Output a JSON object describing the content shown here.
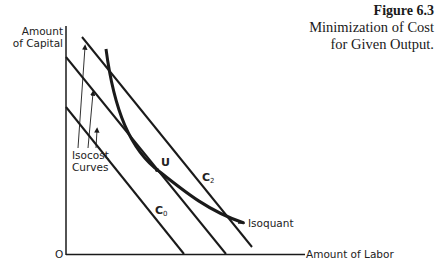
{
  "figure": {
    "number": "Figure 6.3",
    "title_line1": "Minimization of Cost",
    "title_line2": "for Given Output."
  },
  "axes": {
    "y_label_line1": "Amount",
    "y_label_line2": "of Capital",
    "x_label": "Amount of Labor",
    "origin_label": "O"
  },
  "labels": {
    "isocost_line1": "Isocost",
    "isocost_line2": "Curves",
    "tangency_point": "U",
    "c2_letter": "C",
    "c2_sub": "2",
    "c0_letter": "C",
    "c0_sub": "0",
    "isoquant": "Isoquant"
  },
  "colors": {
    "ink": "#1a1a1a",
    "background": "#ffffff"
  }
}
